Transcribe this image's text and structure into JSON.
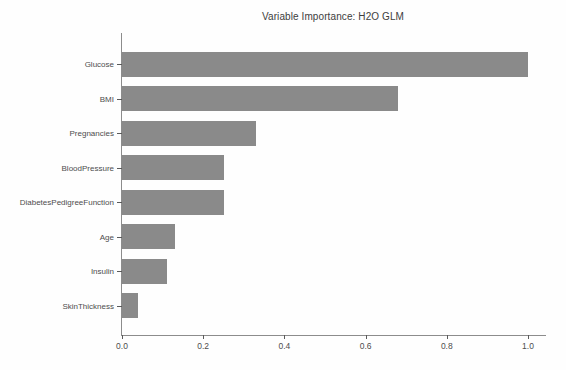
{
  "figure": {
    "background_color": "#fefefe"
  },
  "chart_data": {
    "type": "bar",
    "orientation": "horizontal",
    "title": "Variable Importance: H2O GLM",
    "categories": [
      "Glucose",
      "BMI",
      "Pregnancies",
      "BloodPressure",
      "DiabetesPedigreeFunction",
      "Age",
      "Insulin",
      "SkinThickness"
    ],
    "values": [
      1.0,
      0.68,
      0.33,
      0.25,
      0.25,
      0.13,
      0.11,
      0.04
    ],
    "xlabel": "",
    "ylabel": "",
    "xlim": [
      0.0,
      1.044
    ],
    "x_ticks": [
      {
        "value": 0.0,
        "label": "0.0"
      },
      {
        "value": 0.2,
        "label": "0.2"
      },
      {
        "value": 0.4,
        "label": "0.4"
      },
      {
        "value": 0.6,
        "label": "0.6"
      },
      {
        "value": 0.8,
        "label": "0.8"
      },
      {
        "value": 1.0,
        "label": "1.0"
      }
    ],
    "grid": false,
    "legend": "none",
    "bar_color": "#8a8a8a",
    "axis_color": "#8c8c8c",
    "tick_color": "#5a5a5a",
    "text_color": "#4d4d4d"
  }
}
